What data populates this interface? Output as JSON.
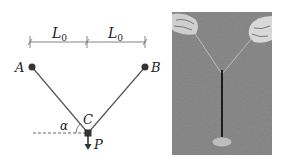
{
  "diagram": {
    "dimension_labels": [
      {
        "main": "L",
        "sub": "0"
      },
      {
        "main": "L",
        "sub": "0"
      }
    ],
    "points": {
      "A": "A",
      "B": "B",
      "C": "C",
      "P": "P"
    },
    "angle_label": "α",
    "colors": {
      "line": "#555555",
      "dot": "#333333",
      "text": "#222222"
    }
  },
  "photo": {
    "description": "Two hands holding threads attached to a vertical rod standing on a base",
    "background": "#8a8a8a"
  }
}
